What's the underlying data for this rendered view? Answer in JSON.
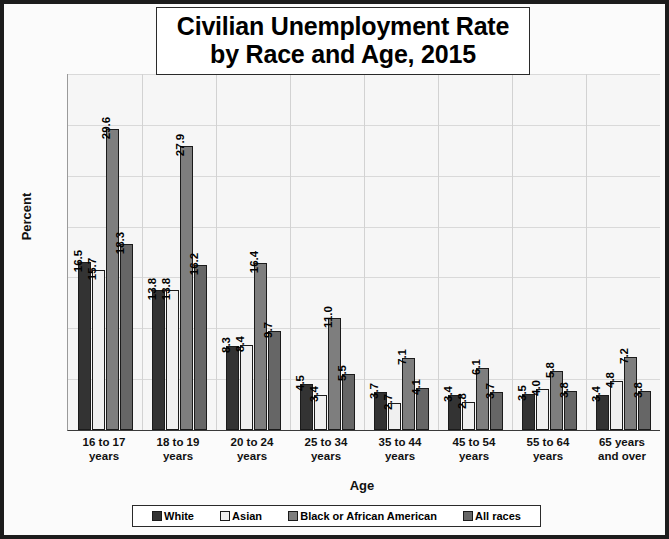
{
  "chart_data": {
    "type": "bar",
    "title": "Civilian Unemployment Rate by Race and Age, 2015",
    "title_lines": [
      "Civilian Unemployment Rate",
      "by Race and Age, 2015"
    ],
    "xlabel": "Age",
    "ylabel": "Percent",
    "ylim": [
      0,
      35
    ],
    "yticks": [
      35,
      30,
      25,
      20,
      15,
      10,
      5,
      0
    ],
    "grid": true,
    "legend_position": "bottom",
    "categories": [
      "16 to 17 years",
      "18 to 19 years",
      "20 to 24 years",
      "25 to 34 years",
      "35 to 44 years",
      "45 to 54 years",
      "55 to 64 years",
      "65 years and over"
    ],
    "category_lines": [
      [
        "16 to 17",
        "years"
      ],
      [
        "18 to 19",
        "years"
      ],
      [
        "20 to 24",
        "years"
      ],
      [
        "25 to 34",
        "years"
      ],
      [
        "35 to 44",
        "years"
      ],
      [
        "45 to 54",
        "years"
      ],
      [
        "55 to 64",
        "years"
      ],
      [
        "65 years",
        "and over"
      ]
    ],
    "series": [
      {
        "name": "White",
        "color": "#333333",
        "values": [
          16.5,
          13.8,
          8.3,
          4.5,
          3.7,
          3.4,
          3.5,
          3.4
        ]
      },
      {
        "name": "Asian",
        "color": "#f0f0f0",
        "values": [
          15.7,
          13.8,
          8.4,
          3.4,
          2.7,
          2.8,
          4.0,
          4.8
        ]
      },
      {
        "name": "Black or African American",
        "color": "#7e7e7e",
        "values": [
          29.6,
          27.9,
          16.4,
          11.0,
          7.1,
          6.1,
          5.8,
          7.2
        ]
      },
      {
        "name": "All races",
        "color": "#666666",
        "values": [
          18.3,
          16.2,
          9.7,
          5.5,
          4.1,
          3.7,
          3.8,
          3.8
        ]
      }
    ],
    "data_labels": [
      [
        "16.5",
        "15.7",
        "29.6",
        "18.3"
      ],
      [
        "13.8",
        "13.8",
        "27.9",
        "16.2"
      ],
      [
        "8.3",
        "8.4",
        "16.4",
        "9.7"
      ],
      [
        "4.5",
        "3.4",
        "11.0",
        "5.5"
      ],
      [
        "3.7",
        "2.7",
        "7.1",
        "4.1"
      ],
      [
        "3.4",
        "2.8",
        "6.1",
        "3.7"
      ],
      [
        "3.5",
        "4.0",
        "5.8",
        "3.8"
      ],
      [
        "3.4",
        "4.8",
        "7.2",
        "3.8"
      ]
    ]
  }
}
